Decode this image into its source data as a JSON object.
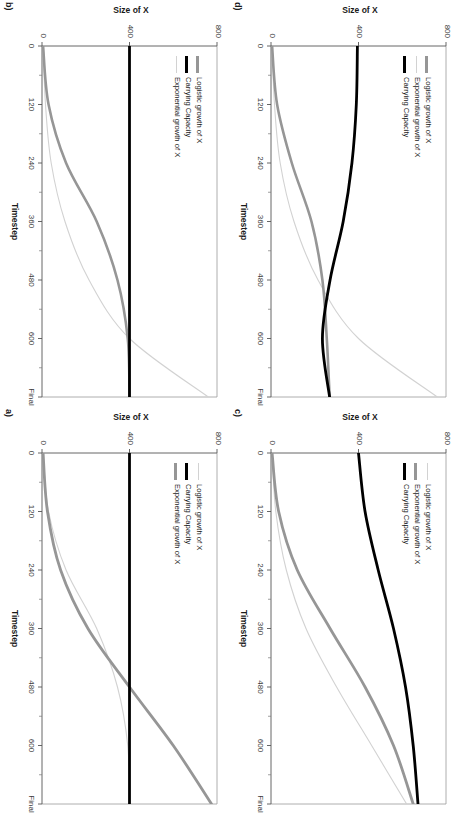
{
  "figure": {
    "panels": [
      {
        "id": "b",
        "letter": "b)",
        "position": "top-left",
        "xlabel": "Timestep",
        "ylabel": "Size of X",
        "xticks": [
          "0",
          "120",
          "240",
          "360",
          "480",
          "600",
          "Final"
        ],
        "yticks": [
          "0",
          "400",
          "800"
        ],
        "legend": [
          {
            "label": "Logistic growth of X",
            "color": "#969696",
            "width": 2.6
          },
          {
            "label": "Carrying Capacity",
            "color": "#000000",
            "width": 2.8
          },
          {
            "label": "Exponential growth of X",
            "color": "#d2d2d2",
            "width": 1.1
          }
        ]
      },
      {
        "id": "d",
        "letter": "d)",
        "position": "top-right",
        "xlabel": "Timestep",
        "ylabel": "Size of X",
        "xticks": [
          "0",
          "120",
          "240",
          "360",
          "480",
          "600",
          "Final"
        ],
        "yticks": [
          "0",
          "400",
          "800"
        ],
        "legend": [
          {
            "label": "Logistic growth of X",
            "color": "#969696",
            "width": 2.6
          },
          {
            "label": "Exponential growth of X",
            "color": "#d2d2d2",
            "width": 1.1
          },
          {
            "label": "Carrying Capacity",
            "color": "#000000",
            "width": 2.8
          }
        ]
      },
      {
        "id": "a",
        "letter": "a)",
        "position": "bottom-left",
        "xlabel": "Timestep",
        "ylabel": "Size of X",
        "xticks": [
          "0",
          "120",
          "240",
          "360",
          "480",
          "600",
          "Final"
        ],
        "yticks": [
          "0",
          "400",
          "800"
        ],
        "legend": [
          {
            "label": "Logistic growth of X",
            "color": "#d2d2d2",
            "width": 1.1
          },
          {
            "label": "Carrying Capacity",
            "color": "#000000",
            "width": 2.8
          },
          {
            "label": "Exponential growth of X",
            "color": "#969696",
            "width": 2.8
          }
        ]
      },
      {
        "id": "c",
        "letter": "c)",
        "position": "bottom-right",
        "xlabel": "Timestep",
        "ylabel": "Size of X",
        "xticks": [
          "0",
          "120",
          "240",
          "360",
          "480",
          "600",
          "Final"
        ],
        "yticks": [
          "0",
          "400",
          "800"
        ],
        "legend": [
          {
            "label": "Logistic growth of X",
            "color": "#d2d2d2",
            "width": 1.1
          },
          {
            "label": "Exponential growth of X",
            "color": "#969696",
            "width": 2.8
          },
          {
            "label": "Carrying Capacity",
            "color": "#000000",
            "width": 2.8
          }
        ]
      }
    ]
  },
  "chart_data": [
    {
      "panel": "b",
      "type": "line",
      "title": "b)",
      "xlabel": "Timestep",
      "ylabel": "Size of X",
      "xticklabels": [
        "0",
        "120",
        "240",
        "360",
        "480",
        "600",
        "Final"
      ],
      "x": [
        0,
        120,
        240,
        360,
        480,
        600,
        720
      ],
      "xlim": [
        0,
        720
      ],
      "ylim": [
        0,
        800
      ],
      "yticks": [
        0,
        400,
        800
      ],
      "grid": false,
      "legend_position": "upper-left",
      "series": [
        {
          "name": "Logistic growth of X",
          "color": "#969696",
          "values": [
            5,
            30,
            110,
            250,
            345,
            392,
            400
          ]
        },
        {
          "name": "Carrying Capacity",
          "color": "#000000",
          "values": [
            400,
            400,
            400,
            400,
            400,
            400,
            400
          ]
        },
        {
          "name": "Exponential growth of X",
          "color": "#d2d2d2",
          "values": [
            5,
            16,
            42,
            105,
            215,
            400,
            760
          ]
        }
      ]
    },
    {
      "panel": "d",
      "type": "line",
      "title": "d)",
      "xlabel": "Timestep",
      "ylabel": "Size of X",
      "xticklabels": [
        "0",
        "120",
        "240",
        "360",
        "480",
        "600",
        "Final"
      ],
      "x": [
        0,
        120,
        240,
        360,
        480,
        600,
        720
      ],
      "xlim": [
        0,
        720
      ],
      "ylim": [
        0,
        800
      ],
      "yticks": [
        0,
        400,
        800
      ],
      "grid": false,
      "legend_position": "upper-left",
      "series": [
        {
          "name": "Logistic growth of X",
          "color": "#969696",
          "values": [
            5,
            28,
            95,
            185,
            235,
            255,
            268
          ]
        },
        {
          "name": "Exponential growth of X",
          "color": "#d2d2d2",
          "values": [
            5,
            16,
            42,
            105,
            215,
            400,
            760
          ]
        },
        {
          "name": "Carrying Capacity",
          "color": "#000000",
          "values": [
            395,
            390,
            370,
            330,
            270,
            235,
            268
          ]
        }
      ]
    },
    {
      "panel": "a",
      "type": "line",
      "title": "a)",
      "xlabel": "Timestep",
      "ylabel": "Size of X",
      "xticklabels": [
        "0",
        "120",
        "240",
        "360",
        "480",
        "600",
        "Final"
      ],
      "x": [
        0,
        120,
        240,
        360,
        480,
        600,
        720
      ],
      "xlim": [
        0,
        720
      ],
      "ylim": [
        0,
        800
      ],
      "yticks": [
        0,
        400,
        800
      ],
      "grid": false,
      "legend_position": "upper-left",
      "series": [
        {
          "name": "Logistic growth of X",
          "color": "#d2d2d2",
          "values": [
            5,
            30,
            110,
            250,
            345,
            392,
            400
          ]
        },
        {
          "name": "Carrying Capacity",
          "color": "#000000",
          "values": [
            400,
            400,
            400,
            400,
            400,
            400,
            400
          ]
        },
        {
          "name": "Exponential growth of X",
          "color": "#969696",
          "values": [
            5,
            25,
            85,
            210,
            400,
            600,
            775
          ]
        }
      ]
    },
    {
      "panel": "c",
      "type": "line",
      "title": "c)",
      "xlabel": "Timestep",
      "ylabel": "Size of X",
      "xticklabels": [
        "0",
        "120",
        "240",
        "360",
        "480",
        "600",
        "Final"
      ],
      "x": [
        0,
        120,
        240,
        360,
        480,
        600,
        720
      ],
      "xlim": [
        0,
        720
      ],
      "ylim": [
        0,
        800
      ],
      "yticks": [
        0,
        400,
        800
      ],
      "grid": false,
      "legend_position": "upper-left",
      "series": [
        {
          "name": "Logistic growth of X",
          "color": "#d2d2d2",
          "values": [
            5,
            22,
            70,
            160,
            300,
            460,
            620
          ]
        },
        {
          "name": "Exponential growth of X",
          "color": "#969696",
          "values": [
            5,
            35,
            120,
            270,
            430,
            560,
            650
          ]
        },
        {
          "name": "Carrying Capacity",
          "color": "#000000",
          "values": [
            400,
            430,
            490,
            560,
            615,
            650,
            672
          ]
        }
      ]
    }
  ]
}
